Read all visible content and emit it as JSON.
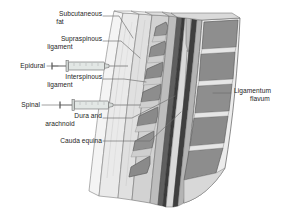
{
  "figure": {
    "view": "sagittal-lumbar-spine"
  },
  "labels": {
    "subcutaneous_fat": "Subcutaneous\nfat",
    "subcutaneous_fat_line1": "Subcutaneous",
    "subcutaneous_fat_line2": "fat",
    "supraspinous_ligament_line1": "Supraspinous",
    "supraspinous_ligament_line2": "ligament",
    "epidural": "Epidural",
    "interspinous_ligament_line1": "Interspinous",
    "interspinous_ligament_line2": "ligament",
    "spinal": "Spinal",
    "dura_and_arachnoid_line1": "Dura and",
    "dura_and_arachnoid_line2": "arachnoid",
    "cauda_equina": "Cauda equina",
    "ligamentum_flavum_line1": "Ligamentum",
    "ligamentum_flavum_line2": "flavum"
  },
  "colors": {
    "background": "#ffffff",
    "outline": "#4a4a4a",
    "leader_line": "#6b6b6b",
    "text": "#1d1d1d",
    "skin_fat": "#efefef",
    "skin_fat_edge": "#9a9a9a",
    "supraspinous": "#e2e2e2",
    "interspinous": "#d6d6d6",
    "spinous_process": "#8d8d8d",
    "spinous_process_dark": "#7d7d7d",
    "ligamentum_flavum": "#b8b8b8",
    "epidural_space": "#5a5a5a",
    "dura": "#3a3a3a",
    "csf": "#d8d8d8",
    "cauda_equina": "#6e6e6e",
    "vertebral_body": "#8a8a8a",
    "disc": "#dcdcdc",
    "syringe_barrel": "#dfe4e2",
    "syringe_edge": "#707070",
    "needle": "#8a8a8a"
  },
  "syringes": [
    {
      "name": "epidural-syringe",
      "label": "Epidural",
      "y": 66,
      "x_plunger_tip": 52,
      "x_needle_tip": 123
    },
    {
      "name": "spinal-syringe",
      "label": "Spinal",
      "y": 105,
      "x_plunger_tip": 60,
      "x_needle_tip": 133
    }
  ],
  "anatomy_layers": [
    "subcutaneous fat",
    "supraspinous ligament",
    "interspinous ligament",
    "spinous processes",
    "ligamentum flavum",
    "epidural space",
    "dura and arachnoid",
    "cauda equina",
    "vertebral bodies",
    "intervertebral discs"
  ]
}
